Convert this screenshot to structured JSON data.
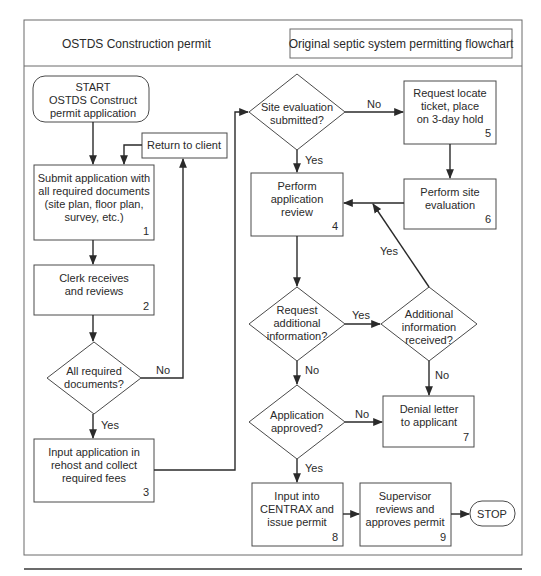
{
  "header": {
    "left_title": "OSTDS Construction permit",
    "right_title": "Original septic system permitting flowchart"
  },
  "nodes": {
    "start": {
      "lines": [
        "START",
        "OSTDS Construct",
        "permit application"
      ]
    },
    "submit": {
      "lines": [
        "Submit application with",
        "all required documents",
        "(site plan, floor plan,",
        "survey, etc.)"
      ],
      "number": "1"
    },
    "return_client": {
      "lines": [
        "Return to client"
      ]
    },
    "clerk": {
      "lines": [
        "Clerk receives",
        "and reviews"
      ],
      "number": "2"
    },
    "all_docs": {
      "lines": [
        "All required",
        "documents?"
      ]
    },
    "input_rehost": {
      "lines": [
        "Input application in",
        "rehost and collect",
        "required fees"
      ],
      "number": "3"
    },
    "site_eval_submitted": {
      "lines": [
        "Site evaluation",
        "submitted?"
      ]
    },
    "request_locate": {
      "lines": [
        "Request locate",
        "ticket, place",
        "on 3-day hold"
      ],
      "number": "5"
    },
    "perform_review": {
      "lines": [
        "Perform",
        "application",
        "review"
      ],
      "number": "4"
    },
    "perform_site_eval": {
      "lines": [
        "Perform site",
        "evaluation"
      ],
      "number": "6"
    },
    "request_info": {
      "lines": [
        "Request",
        "additional",
        "information?"
      ]
    },
    "info_received": {
      "lines": [
        "Additional",
        "information",
        "received?"
      ]
    },
    "approved": {
      "lines": [
        "Application",
        "approved?"
      ]
    },
    "denial": {
      "lines": [
        "Denial letter",
        "to applicant"
      ],
      "number": "7"
    },
    "centrax": {
      "lines": [
        "Input into",
        "CENTRAX and",
        "issue permit"
      ],
      "number": "8"
    },
    "supervisor": {
      "lines": [
        "Supervisor",
        "reviews and",
        "approves permit"
      ],
      "number": "9"
    },
    "stop": {
      "lines": [
        "STOP"
      ]
    }
  },
  "edge_labels": {
    "all_docs_no": "No",
    "all_docs_yes": "Yes",
    "site_eval_no": "No",
    "site_eval_yes": "Yes",
    "request_info_yes": "Yes",
    "request_info_no": "No",
    "info_received_yes": "Yes",
    "info_received_no": "No",
    "approved_no": "No",
    "approved_yes": "Yes"
  }
}
